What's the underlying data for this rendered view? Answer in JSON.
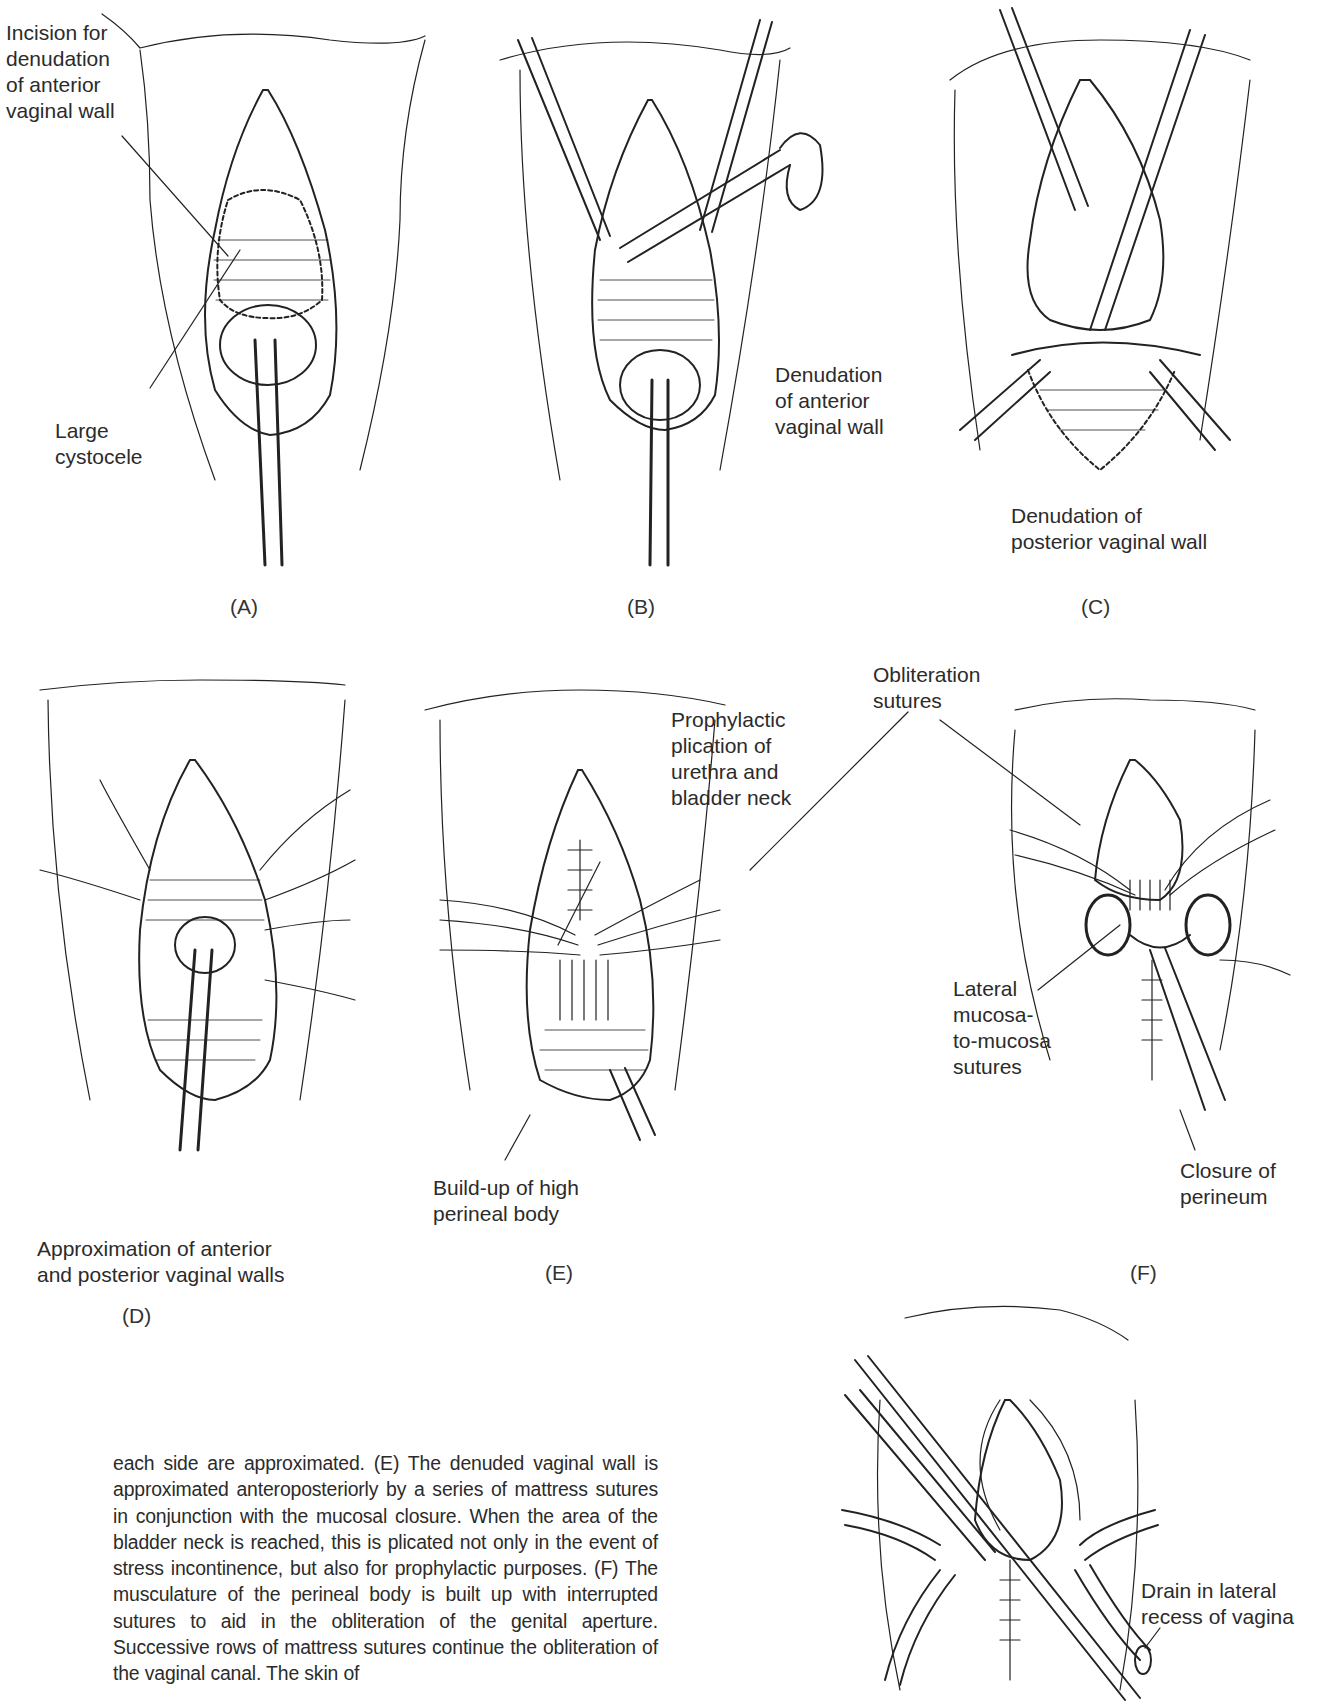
{
  "figure": {
    "panels": [
      {
        "id": "A",
        "tag": "(A)",
        "labels": [
          "Incision for\ndenudation\nof anterior\nvaginal wall",
          "Large\ncystocele"
        ]
      },
      {
        "id": "B",
        "tag": "(B)",
        "labels": [
          "Denudation\nof anterior\nvaginal wall"
        ]
      },
      {
        "id": "C",
        "tag": "(C)",
        "labels": [
          "Denudation of\nposterior vaginal wall"
        ]
      },
      {
        "id": "D",
        "tag": "(D)",
        "labels": [
          "Approximation of anterior\nand posterior vaginal walls"
        ]
      },
      {
        "id": "E",
        "tag": "(E)",
        "labels": [
          "Prophylactic\nplication of\nurethra and\nbladder neck",
          "Build-up of high\nperineal body"
        ]
      },
      {
        "id": "F",
        "tag": "(F)",
        "labels": [
          "Obliteration\nsutures",
          "Lateral\nmucosa-\nto-mucosa\nsutures",
          "Closure of\nperineum"
        ]
      },
      {
        "id": "G",
        "tag": "",
        "labels": [
          "Drain in lateral\nrecess of vagina"
        ]
      }
    ]
  },
  "caption": {
    "text": "each side are approximated. (E) The denuded vaginal wall is approximated anteroposteriorly by a series of mattress sutures in conjunction with the mucosal closure. When the area of the bladder neck is reached, this is plicated not only in the event of stress incontinence, but also for prophylactic purposes. (F) The musculature of the perineal body is built up with interrupted sutures to aid in the obliteration of the genital aperture. Successive rows of mattress sutures continue the obliteration of the vaginal canal. The skin of"
  }
}
